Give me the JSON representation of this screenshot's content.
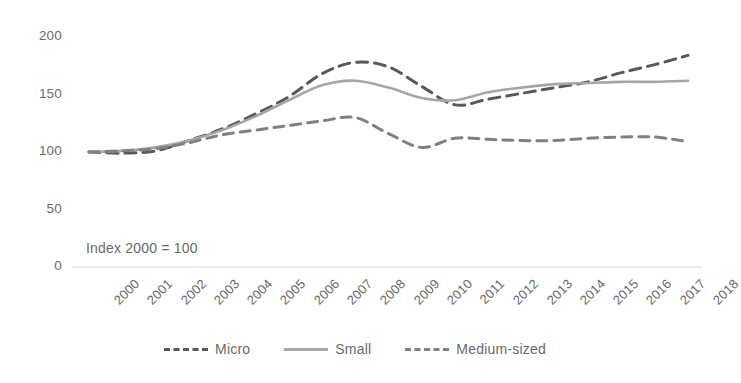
{
  "chart_data": {
    "type": "line",
    "title": "",
    "subtitle": "",
    "xlabel": "",
    "ylabel": "",
    "annotation": "Index 2000 = 100",
    "grid": false,
    "legend_position": "bottom",
    "ylim": [
      0,
      200
    ],
    "yticks": [
      0,
      50,
      100,
      150,
      200
    ],
    "ytick_labels": [
      "0",
      "50",
      "100",
      "150",
      "200"
    ],
    "x": [
      2000,
      2001,
      2002,
      2003,
      2004,
      2005,
      2006,
      2007,
      2008,
      2009,
      2010,
      2011,
      2012,
      2013,
      2014,
      2015,
      2016,
      2017,
      2018
    ],
    "xtick_labels": [
      "2000",
      "2001",
      "2002",
      "2003",
      "2004",
      "2005",
      "2006",
      "2007",
      "2008",
      "2009",
      "2010",
      "2011",
      "2012",
      "2013",
      "2014",
      "2015",
      "2016",
      "2017",
      "2018"
    ],
    "series": [
      {
        "name": "Micro",
        "color": "#595959",
        "style": "dashed",
        "width": 3,
        "values": [
          100,
          99,
          101,
          110,
          120,
          133,
          148,
          168,
          178,
          174,
          157,
          141,
          146,
          151,
          156,
          161,
          169,
          176,
          184
        ]
      },
      {
        "name": "Small",
        "color": "#a6a6a6",
        "style": "solid",
        "width": 2.6,
        "values": [
          100,
          101,
          104,
          110,
          119,
          131,
          145,
          158,
          162,
          156,
          147,
          145,
          152,
          156,
          159,
          160,
          161,
          161,
          162
        ]
      },
      {
        "name": "Medium-sized",
        "color": "#808080",
        "style": "dashed",
        "width": 3,
        "values": [
          100,
          101,
          103,
          108,
          115,
          119,
          123,
          127,
          130,
          116,
          104,
          112,
          111,
          110,
          110,
          112,
          113,
          113,
          109
        ]
      }
    ]
  },
  "legend": {
    "items": [
      {
        "label": "Micro",
        "color": "#595959",
        "style": "dashed"
      },
      {
        "label": "Small",
        "color": "#a6a6a6",
        "style": "solid"
      },
      {
        "label": "Medium-sized",
        "color": "#808080",
        "style": "dashed"
      }
    ]
  },
  "axis": {
    "baseline_color": "#d9d9d9"
  }
}
